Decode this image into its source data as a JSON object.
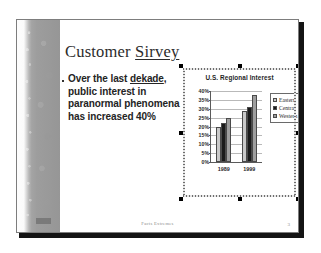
{
  "slide": {
    "title_prefix": "Customer ",
    "title_misspelled": "Sirvey",
    "bullet": {
      "before": "Over the last ",
      "misspelled": "dekade",
      "after": ", public interest in paranormal phenomena has increased 40%"
    },
    "footer_center": "Facts Extremes",
    "footer_page": "3",
    "band_mark": ""
  },
  "chart_data": {
    "type": "bar",
    "title": "U.S. Regional Interest",
    "xlabel": "",
    "ylabel": "",
    "categories": [
      "1989",
      "1999"
    ],
    "series": [
      {
        "name": "Eastern",
        "color": "#c9c9c9",
        "values": [
          20,
          29
        ]
      },
      {
        "name": "Central",
        "color": "#1a1a1a",
        "values": [
          22,
          31
        ]
      },
      {
        "name": "Western",
        "color": "#9e9e9e",
        "values": [
          25,
          38
        ]
      }
    ],
    "ylim": [
      0,
      40
    ],
    "ytick_labels": [
      "40%",
      "35%",
      "30%",
      "25%",
      "20%",
      "15%",
      "10%",
      "5%",
      "0%"
    ],
    "ytick_values": [
      40,
      35,
      30,
      25,
      20,
      15,
      10,
      5,
      0
    ],
    "grid": true,
    "legend_position": "right",
    "value_suffix": "%"
  }
}
